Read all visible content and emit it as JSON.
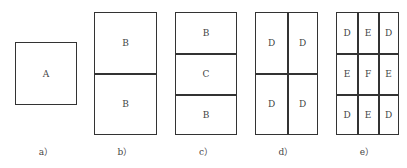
{
  "panels": {
    "a": {
      "caption": "a）",
      "cells": [
        "A"
      ]
    },
    "b": {
      "caption": "b）",
      "cells": [
        "B",
        "B"
      ]
    },
    "c": {
      "caption": "c）",
      "cells": [
        "B",
        "C",
        "B"
      ]
    },
    "d": {
      "caption": "d）",
      "cells": [
        "D",
        "D",
        "D",
        "D"
      ]
    },
    "e": {
      "caption": "e）",
      "cells": [
        "D",
        "E",
        "D",
        "E",
        "F",
        "E",
        "D",
        "E",
        "D"
      ]
    }
  }
}
